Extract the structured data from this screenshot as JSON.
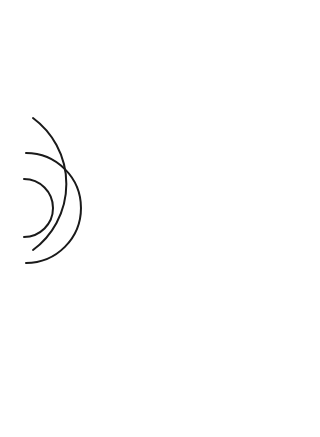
{
  "diagram": {
    "source_label": "L",
    "colors": {
      "line": "#1a1a1a",
      "wall": "#000000",
      "obstacle": "#454545",
      "background": "#ffffff"
    },
    "source": {
      "x": 24,
      "y": 208
    },
    "wave_radii": [
      29,
      55,
      82,
      108,
      134,
      160,
      186,
      212,
      238,
      264
    ],
    "wall": {
      "x": 303,
      "y1": 24,
      "y2": 417
    }
  }
}
